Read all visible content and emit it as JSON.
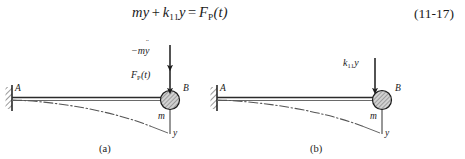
{
  "equation": {
    "mass_symbol": "m",
    "accel_symbol": "y",
    "accel_dots": "¨",
    "plus": "+",
    "stiffness_symbol": "k",
    "stiffness_sub": "11",
    "displacement_symbol": "y",
    "equals": "=",
    "force_symbol": "F",
    "force_sub": "P",
    "force_arg": "(t)",
    "number": "(11-17)"
  },
  "figure": {
    "panels": [
      {
        "caption": "(a)",
        "support_label": "A",
        "node_label": "B",
        "mass_label": "m",
        "axis_label": "y",
        "forces": [
          {
            "label_prefix": "−m",
            "label_symbol": "y",
            "label_dots": "¨",
            "label_suffix": "",
            "label_sub": ""
          },
          {
            "label_prefix": "F",
            "label_symbol": "",
            "label_dots": "",
            "label_suffix": "(t)",
            "label_sub": "P"
          }
        ]
      },
      {
        "caption": "(b)",
        "support_label": "A",
        "node_label": "B",
        "mass_label": "m",
        "axis_label": "y",
        "forces": [
          {
            "label_prefix": "k",
            "label_symbol": "y",
            "label_dots": "",
            "label_suffix": "",
            "label_sub": "11"
          }
        ]
      }
    ]
  },
  "colors": {
    "ink": "#1a1a1a",
    "beam": "#2b2b2b",
    "curve": "#555555",
    "hatch": "#444444",
    "mass_fill": "#c9c9c9",
    "background": "#ffffff"
  }
}
